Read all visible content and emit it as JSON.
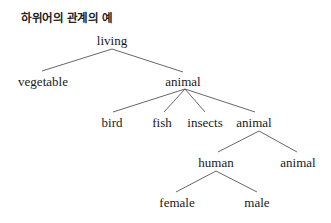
{
  "title": "하위어의 관계의 예",
  "nodes": {
    "living": "living",
    "vegetable": "vegetable",
    "animal": "animal",
    "bird": "bird",
    "fish": "fish",
    "insects": "insects",
    "animal2": "animal",
    "human": "human",
    "animal3": "animal",
    "female": "female",
    "male": "male"
  },
  "edges": [
    [
      "living",
      "vegetable"
    ],
    [
      "living",
      "animal"
    ],
    [
      "animal",
      "bird"
    ],
    [
      "animal",
      "fish"
    ],
    [
      "animal",
      "insects"
    ],
    [
      "animal",
      "animal2"
    ],
    [
      "animal2",
      "human"
    ],
    [
      "animal2",
      "animal3"
    ],
    [
      "human",
      "female"
    ],
    [
      "human",
      "male"
    ]
  ],
  "line_color": "#555555"
}
